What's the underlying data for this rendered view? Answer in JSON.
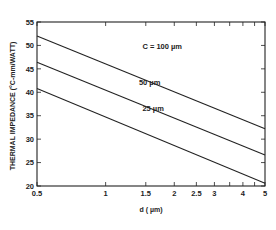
{
  "chart_data": {
    "type": "line",
    "title": "",
    "xlabel": "d ( µm)",
    "ylabel": "THERMAL IMPEDANCE (°C-mm/WATT)",
    "xscale": "log",
    "xlim": [
      0.5,
      5
    ],
    "ylim": [
      20,
      55
    ],
    "grid": false,
    "legend": "inline labels",
    "x_ticks": [
      0.5,
      1,
      1.5,
      2,
      2.5,
      3,
      4,
      5
    ],
    "x_tick_labels": [
      "0.5",
      "1",
      "1.5",
      "2",
      "2.5",
      "3",
      "4",
      "5"
    ],
    "x_minor_ticks": [
      3.5,
      4.5
    ],
    "y_ticks": [
      20,
      25,
      30,
      35,
      40,
      45,
      50,
      55
    ],
    "y_tick_labels": [
      "20",
      "25",
      "30",
      "35",
      "40",
      "45",
      "50",
      "55"
    ],
    "x": [
      0.5,
      5
    ],
    "series": [
      {
        "name": "C = 100 µm",
        "label": "C = 100 µm",
        "values": [
          52.0,
          32.2
        ]
      },
      {
        "name": "50 µm",
        "label": "50 µm",
        "values": [
          46.4,
          26.6
        ]
      },
      {
        "name": "25 µm",
        "label": "25 µm",
        "values": [
          40.8,
          20.6
        ]
      }
    ],
    "label_positions": [
      {
        "x": 1.45,
        "y": 49.2
      },
      {
        "x": 1.4,
        "y": 41.6
      },
      {
        "x": 1.45,
        "y": 35.9
      }
    ],
    "colors": {
      "line": "#222222",
      "axis": "#222222",
      "background": "#ffffff"
    }
  }
}
